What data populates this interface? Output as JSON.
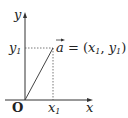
{
  "diagram": {
    "axes": {
      "x_label": "x",
      "y_label": "y",
      "origin_label": "O"
    },
    "point": {
      "x_label": "x",
      "x_subscript": "1",
      "y_label": "y",
      "y_subscript": "1"
    },
    "vector": {
      "name": "a",
      "equation_prefix": " = (",
      "x_component": "x",
      "x_sub": "1",
      "separator": ",  ",
      "y_component": "y",
      "y_sub": "1",
      "equation_suffix": ")"
    },
    "colors": {
      "ink": "#222222",
      "background": "#ffffff"
    }
  }
}
